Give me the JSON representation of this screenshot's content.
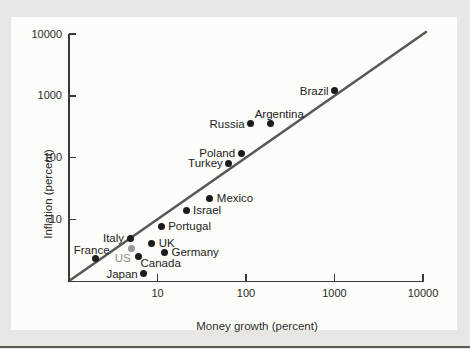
{
  "figure": {
    "colors": {
      "page_background": "#e7e6e3",
      "panel_background": "#fcfcf9",
      "axis": "#3a3a3a",
      "point": "#1c1c1c",
      "highlight_point": "#98989a",
      "highlight_label": "#8f8f91",
      "reference_line": "#58585a",
      "text": "#2b2b2b",
      "bottom_rule": "#5f5a56"
    }
  },
  "chart_data": {
    "type": "scatter",
    "title": "",
    "xlabel": "Money growth (percent)",
    "ylabel": "Inflation (percent)",
    "x_scale": "log",
    "y_scale": "log",
    "xlim": [
      1,
      10000
    ],
    "ylim": [
      1,
      10000
    ],
    "x_ticks": [
      10,
      100,
      1000,
      10000
    ],
    "y_ticks": [
      10,
      100,
      1000,
      10000
    ],
    "grid": false,
    "legend": "none",
    "reference_line": {
      "description": "45-degree line where inflation equals money growth",
      "from_xy": [
        1,
        1
      ],
      "to_xy": [
        10000,
        10000
      ]
    },
    "points": [
      {
        "label": "Brazil",
        "money_growth": 1000,
        "inflation": 1200,
        "label_side": "left",
        "highlight": false
      },
      {
        "label": "Argentina",
        "money_growth": 190,
        "inflation": 350,
        "label_side": "above-start",
        "highlight": false
      },
      {
        "label": "Russia",
        "money_growth": 113,
        "inflation": 350,
        "label_side": "left",
        "highlight": false
      },
      {
        "label": "Poland",
        "money_growth": 88,
        "inflation": 118,
        "label_side": "left",
        "highlight": false
      },
      {
        "label": "Turkey",
        "money_growth": 64,
        "inflation": 80,
        "label_side": "left",
        "highlight": false
      },
      {
        "label": "Mexico",
        "money_growth": 39,
        "inflation": 22,
        "label_side": "right",
        "highlight": false
      },
      {
        "label": "Israel",
        "money_growth": 21,
        "inflation": 14,
        "label_side": "right",
        "highlight": false
      },
      {
        "label": "Portugal",
        "money_growth": 11,
        "inflation": 7.7,
        "label_side": "right",
        "highlight": false
      },
      {
        "label": "UK",
        "money_growth": 8.6,
        "inflation": 4.1,
        "label_side": "right",
        "highlight": false
      },
      {
        "label": "Italy",
        "money_growth": 4.9,
        "inflation": 4.9,
        "label_side": "left",
        "highlight": false
      },
      {
        "label": "Germany",
        "money_growth": 12,
        "inflation": 2.9,
        "label_side": "right",
        "highlight": false
      },
      {
        "label": "US",
        "money_growth": 5.1,
        "inflation": 3.3,
        "label_side": "below-left",
        "highlight": true
      },
      {
        "label": "Canada",
        "money_growth": 6.1,
        "inflation": 2.5,
        "label_side": "below-right",
        "highlight": false
      },
      {
        "label": "France",
        "money_growth": 2.0,
        "inflation": 2.3,
        "label_side": "above-middle",
        "highlight": false
      },
      {
        "label": "Japan",
        "money_growth": 7.0,
        "inflation": 1.3,
        "label_side": "left",
        "highlight": false
      }
    ]
  }
}
